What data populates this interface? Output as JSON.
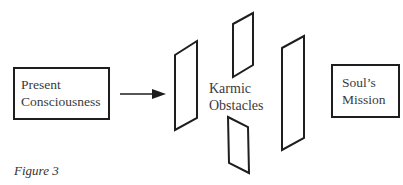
{
  "diagram": {
    "nodes": [
      {
        "id": "present",
        "label_line1": "Present",
        "label_line2": "Consciousness"
      },
      {
        "id": "karmic",
        "label_line1": "Karmic",
        "label_line2": "Obstacles"
      },
      {
        "id": "mission",
        "label_line1": "Soul’s",
        "label_line2": "Mission"
      }
    ],
    "edges": [
      {
        "from": "present",
        "to": "karmic",
        "type": "arrow"
      }
    ],
    "obstacles_count": 4,
    "caption": "Figure 3",
    "colors": {
      "stroke": "#1e1e1e",
      "text": "#3a3a3a",
      "background": "#ffffff"
    }
  }
}
